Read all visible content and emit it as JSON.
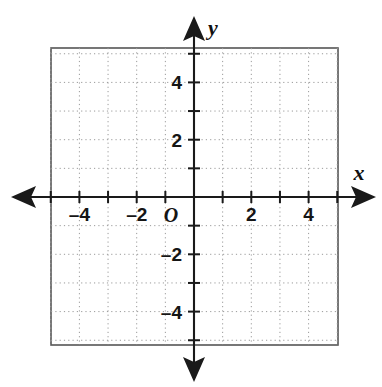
{
  "figure": {
    "kind": "cartesian-coordinate-grid",
    "background_color": "#ffffff",
    "frame_color": "#555555",
    "axis_color": "#1a1a1a",
    "grid_color": "#9a9a9a",
    "label_color": "#151515"
  },
  "axes": {
    "x_axis_name": "x",
    "y_axis_name": "y",
    "origin_label": "O",
    "x_min": -5,
    "x_max": 5,
    "y_min": -5,
    "y_max": 5,
    "tick_step": 1,
    "label_step": 2,
    "grid": "dotted",
    "arrows": [
      "left",
      "right",
      "up",
      "down"
    ]
  },
  "x_tick_labels": [
    {
      "value": -4,
      "text": "–4"
    },
    {
      "value": -2,
      "text": "–2"
    },
    {
      "value": 2,
      "text": "2"
    },
    {
      "value": 4,
      "text": "4"
    }
  ],
  "y_tick_labels": [
    {
      "value": 4,
      "text": "4"
    },
    {
      "value": 2,
      "text": "2"
    },
    {
      "value": -2,
      "text": "–2"
    },
    {
      "value": -4,
      "text": "–4"
    }
  ],
  "chart_data": {
    "type": "scatter",
    "title": "",
    "subtitle": "",
    "xlabel": "x",
    "ylabel": "y",
    "xlim": [
      -5,
      5
    ],
    "ylim": [
      -5,
      5
    ],
    "xticks": [
      -5,
      -4,
      -3,
      -2,
      -1,
      0,
      1,
      2,
      3,
      4,
      5
    ],
    "yticks": [
      -5,
      -4,
      -3,
      -2,
      -1,
      0,
      1,
      2,
      3,
      4,
      5
    ],
    "xticklabels": [
      "",
      "–4",
      "",
      "–2",
      "",
      "O",
      "",
      "2",
      "",
      "4",
      ""
    ],
    "yticklabels": [
      "",
      "–4",
      "",
      "–2",
      "",
      "",
      "",
      "2",
      "",
      "4",
      ""
    ],
    "grid": true,
    "grid_style": "dotted",
    "legend": null,
    "series": [],
    "values": [],
    "annotations": [
      {
        "text": "O",
        "x": -0.35,
        "y": -0.6,
        "role": "origin-label"
      },
      {
        "text": "x",
        "x": 5.7,
        "y": 0.85,
        "role": "x-axis-name"
      },
      {
        "text": "y",
        "x": 0.6,
        "y": 5.9,
        "role": "y-axis-name"
      }
    ]
  }
}
